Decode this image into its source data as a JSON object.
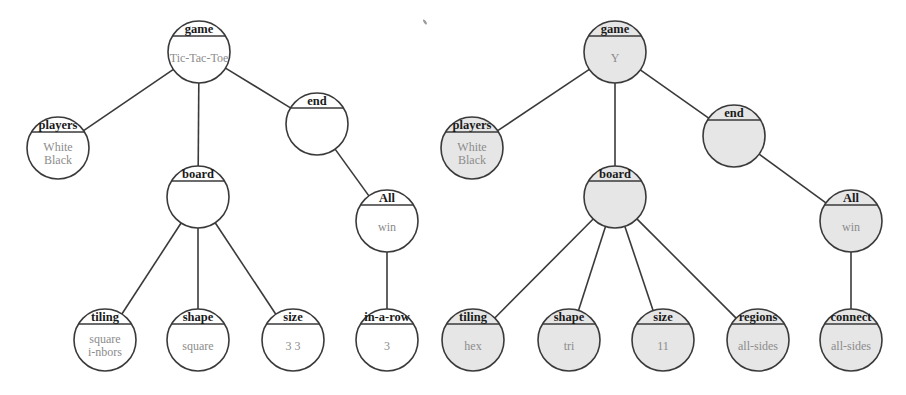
{
  "colors": {
    "stroke": "#3a3a3a",
    "label": "#1a1a1a",
    "value": "#8c8c8c",
    "fill_left": "#ffffff",
    "fill_right": "#e6e6e6"
  },
  "node_radius": 31,
  "trees": [
    {
      "id": "tic-tac-toe",
      "fill": "#ffffff",
      "nodes": [
        {
          "id": "game",
          "label": "game",
          "values": [
            "Tic-Tac-Toe"
          ],
          "x": 199,
          "y": 52
        },
        {
          "id": "players",
          "label": "players",
          "values": [
            "White",
            "Black"
          ],
          "x": 58,
          "y": 148
        },
        {
          "id": "end",
          "label": "end",
          "values": [],
          "x": 317,
          "y": 124
        },
        {
          "id": "board",
          "label": "board",
          "values": [],
          "x": 198,
          "y": 197
        },
        {
          "id": "all",
          "label": "All",
          "values": [
            "win"
          ],
          "x": 387,
          "y": 221
        },
        {
          "id": "tiling",
          "label": "tiling",
          "values": [
            "square",
            "i-nbors"
          ],
          "x": 105,
          "y": 340
        },
        {
          "id": "shape",
          "label": "shape",
          "values": [
            "square"
          ],
          "x": 198,
          "y": 340
        },
        {
          "id": "size",
          "label": "size",
          "values": [
            "3 3"
          ],
          "x": 293,
          "y": 340
        },
        {
          "id": "in-a-row",
          "label": "in-a-row",
          "values": [
            "3"
          ],
          "x": 387,
          "y": 340
        }
      ],
      "edges": [
        [
          "game",
          "players"
        ],
        [
          "game",
          "board"
        ],
        [
          "game",
          "end"
        ],
        [
          "end",
          "all"
        ],
        [
          "board",
          "tiling"
        ],
        [
          "board",
          "shape"
        ],
        [
          "board",
          "size"
        ],
        [
          "all",
          "in-a-row"
        ]
      ]
    },
    {
      "id": "y",
      "fill": "#e6e6e6",
      "nodes": [
        {
          "id": "game",
          "label": "game",
          "values": [
            "Y"
          ],
          "x": 615,
          "y": 52
        },
        {
          "id": "players",
          "label": "players",
          "values": [
            "White",
            "Black"
          ],
          "x": 472,
          "y": 148
        },
        {
          "id": "end",
          "label": "end",
          "values": [],
          "x": 734,
          "y": 136
        },
        {
          "id": "board",
          "label": "board",
          "values": [],
          "x": 615,
          "y": 197
        },
        {
          "id": "all",
          "label": "All",
          "values": [
            "win"
          ],
          "x": 851,
          "y": 221
        },
        {
          "id": "tiling",
          "label": "tiling",
          "values": [
            "hex"
          ],
          "x": 473,
          "y": 340
        },
        {
          "id": "shape",
          "label": "shape",
          "values": [
            "tri"
          ],
          "x": 569,
          "y": 340
        },
        {
          "id": "size",
          "label": "size",
          "values": [
            "11"
          ],
          "x": 663,
          "y": 340
        },
        {
          "id": "regions",
          "label": "regions",
          "values": [
            "all-sides"
          ],
          "x": 758,
          "y": 340
        },
        {
          "id": "connect",
          "label": "connect",
          "values": [
            "all-sides"
          ],
          "x": 851,
          "y": 340
        }
      ],
      "edges": [
        [
          "game",
          "players"
        ],
        [
          "game",
          "board"
        ],
        [
          "game",
          "end"
        ],
        [
          "end",
          "all"
        ],
        [
          "board",
          "tiling"
        ],
        [
          "board",
          "shape"
        ],
        [
          "board",
          "size"
        ],
        [
          "board",
          "regions"
        ],
        [
          "all",
          "connect"
        ]
      ]
    }
  ]
}
